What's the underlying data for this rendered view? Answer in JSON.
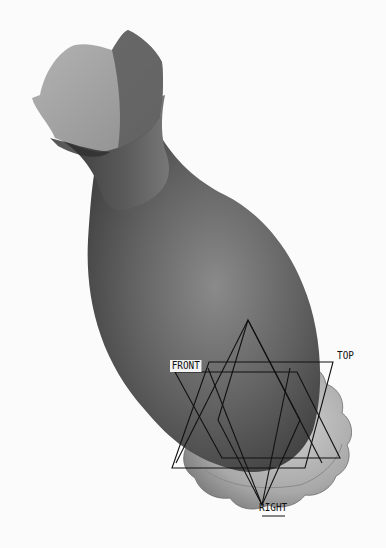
{
  "viewport": {
    "model": "gourd-vase-solid",
    "background": "#fbfbfb",
    "model_colors": {
      "body_dark": "#4a4a4a",
      "body_mid": "#6e6e6e",
      "body_light": "#8c8c8c",
      "lip_light": "#a9a9a9",
      "base_light": "#b8b8b8",
      "datum_line": "#111111"
    }
  },
  "datums": {
    "front": {
      "label": "FRONT"
    },
    "top": {
      "label": "TOP"
    },
    "right": {
      "label": "RIGHT"
    }
  }
}
